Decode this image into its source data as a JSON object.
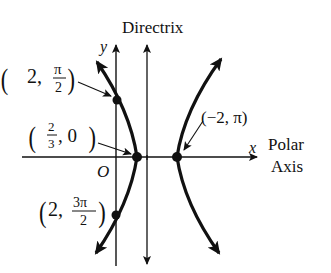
{
  "diagram": {
    "title_fragment": "",
    "labels": {
      "directrix": "Directrix",
      "y_axis": "y",
      "x_axis": "x",
      "polar": "Polar",
      "axis": "Axis",
      "origin": "O"
    },
    "points": [
      {
        "id": "p1",
        "label_r": "2,",
        "label_num": "π",
        "label_den": "2",
        "description": "(2, π/2)"
      },
      {
        "id": "p2",
        "label_num": "2",
        "label_den": "3",
        "label_r": ", 0",
        "description": "(2/3, 0)"
      },
      {
        "id": "p3",
        "label": "(−2, π)",
        "description": "(−2, π)"
      },
      {
        "id": "p4",
        "label_r": "2,",
        "label_num": "3π",
        "label_den": "2",
        "description": "(2, 3π/2)"
      }
    ],
    "colors": {
      "ink": "#111111",
      "background": "#ffffff"
    }
  }
}
